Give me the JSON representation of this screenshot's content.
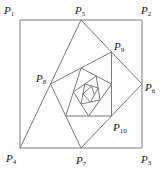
{
  "diagram": {
    "title": "",
    "line_color": "#7a7a7a",
    "label_color": "#1a1a1a",
    "square": {
      "corners": [
        "P1",
        "P2",
        "P3",
        "P4"
      ]
    },
    "construction": "Each new point is the midpoint of the segment joining the point four steps earlier and the next one: P(n) = midpoint(P(n-4), P(n-3)); consecutive points are joined, producing an inward spiral.",
    "points": [
      {
        "name": "P1",
        "letter": "P",
        "sub": "1",
        "x": 20,
        "y": 20,
        "labeled": true,
        "lx": 4,
        "ly": 14
      },
      {
        "name": "P2",
        "letter": "P",
        "sub": "2",
        "x": 142,
        "y": 20,
        "labeled": true,
        "lx": 141,
        "ly": 14
      },
      {
        "name": "P3",
        "letter": "P",
        "sub": "3",
        "x": 142,
        "y": 148,
        "labeled": true,
        "lx": 141,
        "ly": 163
      },
      {
        "name": "P4",
        "letter": "P",
        "sub": "4",
        "x": 20,
        "y": 148,
        "labeled": true,
        "lx": 6,
        "ly": 162
      },
      {
        "name": "P5",
        "letter": "P",
        "sub": "5",
        "x": 81,
        "y": 20,
        "labeled": true,
        "lx": 75,
        "ly": 14
      },
      {
        "name": "P6",
        "letter": "P",
        "sub": "6",
        "x": 142,
        "y": 84,
        "labeled": true,
        "lx": 145,
        "ly": 91
      },
      {
        "name": "P7",
        "letter": "P",
        "sub": "7",
        "x": 81,
        "y": 148,
        "labeled": true,
        "lx": 76,
        "ly": 164
      },
      {
        "name": "P8",
        "letter": "P",
        "sub": "8",
        "x": 50.5,
        "y": 84,
        "labeled": true,
        "lx": 36,
        "ly": 82
      },
      {
        "name": "P9",
        "letter": "P",
        "sub": "9",
        "x": 111.5,
        "y": 52,
        "labeled": true,
        "lx": 114,
        "ly": 50
      },
      {
        "name": "P10",
        "letter": "P",
        "sub": "10",
        "x": 111.5,
        "y": 116,
        "labeled": true,
        "lx": 113,
        "ly": 131
      }
    ],
    "spiral_depth": 24
  }
}
